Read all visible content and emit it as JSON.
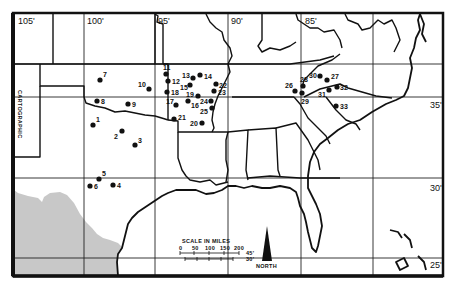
{
  "figure": {
    "type": "map",
    "region": "South-central and southeastern United States",
    "colors": {
      "ink": "#111111",
      "background": "#ffffff",
      "mexico_fill": "#c8c8c8"
    }
  },
  "graticule": {
    "longitude_labels": [
      {
        "text": "105'",
        "x": 20,
        "y": 22
      },
      {
        "text": "100'",
        "x": 87,
        "y": 22
      },
      {
        "text": "95'",
        "x": 160,
        "y": 22
      },
      {
        "text": "90'",
        "x": 232,
        "y": 22
      },
      {
        "text": "85'",
        "x": 306,
        "y": 22
      }
    ],
    "latitude_labels": [
      {
        "text": "35'",
        "x": 432,
        "y": 106
      },
      {
        "text": "30'",
        "x": 432,
        "y": 190
      },
      {
        "text": "25'",
        "x": 432,
        "y": 264
      }
    ]
  },
  "sites": [
    {
      "id": "1",
      "x": 93,
      "y": 125
    },
    {
      "id": "2",
      "x": 122,
      "y": 131
    },
    {
      "id": "3",
      "x": 135,
      "y": 145
    },
    {
      "id": "4",
      "x": 113,
      "y": 185
    },
    {
      "id": "5",
      "x": 99,
      "y": 179
    },
    {
      "id": "6",
      "x": 90,
      "y": 186
    },
    {
      "id": "7",
      "x": 100,
      "y": 80
    },
    {
      "id": "8",
      "x": 97,
      "y": 101
    },
    {
      "id": "9",
      "x": 128,
      "y": 104
    },
    {
      "id": "10",
      "x": 149,
      "y": 89
    },
    {
      "id": "11",
      "x": 166,
      "y": 74
    },
    {
      "id": "12",
      "x": 168,
      "y": 81
    },
    {
      "id": "13",
      "x": 193,
      "y": 78
    },
    {
      "id": "14",
      "x": 200,
      "y": 75
    },
    {
      "id": "15",
      "x": 190,
      "y": 85
    },
    {
      "id": "16",
      "x": 188,
      "y": 101
    },
    {
      "id": "17",
      "x": 176,
      "y": 105
    },
    {
      "id": "18",
      "x": 167,
      "y": 92
    },
    {
      "id": "19",
      "x": 198,
      "y": 96
    },
    {
      "id": "20",
      "x": 202,
      "y": 123
    },
    {
      "id": "21",
      "x": 174,
      "y": 119
    },
    {
      "id": "22",
      "x": 216,
      "y": 84
    },
    {
      "id": "23",
      "x": 214,
      "y": 91
    },
    {
      "id": "24",
      "x": 211,
      "y": 101
    },
    {
      "id": "25",
      "x": 212,
      "y": 108
    },
    {
      "id": "26",
      "x": 295,
      "y": 91
    },
    {
      "id": "27",
      "x": 327,
      "y": 80
    },
    {
      "id": "28",
      "x": 303,
      "y": 86
    },
    {
      "id": "29",
      "x": 302,
      "y": 93
    },
    {
      "id": "30",
      "x": 320,
      "y": 76
    },
    {
      "id": "31",
      "x": 329,
      "y": 90
    },
    {
      "id": "32",
      "x": 337,
      "y": 87
    },
    {
      "id": "33",
      "x": 336,
      "y": 106
    }
  ],
  "scale_bar": {
    "title": "SCALE IN MILES",
    "ticks": [
      "0",
      "50",
      "100",
      "150",
      "200"
    ],
    "latitude_marks": [
      "45'",
      "30'"
    ]
  },
  "north_arrow": {
    "label": "NORTH"
  },
  "edge_annotation": "CARTOGRAPHIC"
}
